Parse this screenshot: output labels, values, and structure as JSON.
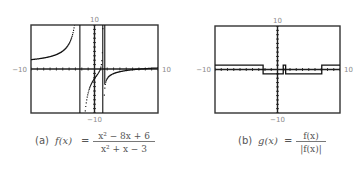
{
  "chart_data": [
    {
      "type": "line",
      "id": "a",
      "caption_prefix": "(a)",
      "function_name": "f(x)",
      "equals": "=",
      "numerator": "x² − 8x + 6",
      "denominator": "x² + x − 3",
      "xlim": [
        -10,
        10
      ],
      "ylim": [
        -10,
        10
      ],
      "tick_labels": {
        "left": "−10",
        "right": "10",
        "top": "10",
        "bottom": "−10"
      },
      "xscale": 1,
      "yscale": 1,
      "grid": false,
      "style": "dot",
      "vertical_asymptotes": [
        -2.303,
        1.303
      ],
      "expression": "(x*x - 8*x + 6)/(x*x + x - 3)"
    },
    {
      "type": "line",
      "id": "b",
      "caption_prefix": "(b)",
      "function_name": "g(x)",
      "equals": "=",
      "numerator": "f(x)",
      "denominator": "|f(x)|",
      "xlim": [
        -10,
        10
      ],
      "ylim": [
        -10,
        10
      ],
      "tick_labels": {
        "left": "−10",
        "right": "10",
        "top": "10",
        "bottom": "−10"
      },
      "xscale": 1,
      "yscale": 1,
      "grid": false,
      "style": "connected",
      "segments": [
        {
          "x": [
            -10,
            -2.303
          ],
          "y": 1
        },
        {
          "x": [
            -2.303,
            0.917
          ],
          "y": -1
        },
        {
          "x": [
            0.917,
            1.303
          ],
          "y": 1
        },
        {
          "x": [
            1.303,
            7.083
          ],
          "y": -1
        },
        {
          "x": [
            7.083,
            10
          ],
          "y": 1
        }
      ]
    }
  ]
}
